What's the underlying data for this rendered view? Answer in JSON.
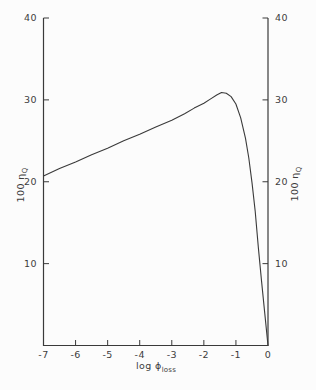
{
  "figure": {
    "background_color": "#fcfcfc",
    "line_color": "#3a3a3a",
    "text_color": "#3d3d3d"
  },
  "chart_data": {
    "type": "line",
    "title": "",
    "xlabel": {
      "text": "log ϕ",
      "sub": "loss"
    },
    "ylabel_left": {
      "text": "100 η",
      "sub": "Q"
    },
    "ylabel_right": {
      "text": "100 η",
      "sub": "Q"
    },
    "xlim": [
      -7,
      0
    ],
    "ylim": [
      0,
      40
    ],
    "x_ticks": [
      -7,
      -6,
      -5,
      -4,
      -3,
      -2,
      -1,
      0
    ],
    "x_tick_labels": [
      "-7",
      "-6",
      "-5",
      "-4",
      "-3",
      "-2",
      "-1",
      "0"
    ],
    "y_ticks": [
      10,
      20,
      30,
      40
    ],
    "y_tick_labels": [
      "10",
      "20",
      "30",
      "40"
    ],
    "grid": false,
    "legend": "none",
    "axes_drawn": [
      "left",
      "bottom",
      "right"
    ],
    "series": [
      {
        "name": "100-eta-Q-vs-log-phi-loss",
        "peak": {
          "x": -1.45,
          "y": 31
        },
        "points": [
          [
            -7.0,
            20.7
          ],
          [
            -6.5,
            21.6
          ],
          [
            -6.0,
            22.4
          ],
          [
            -5.5,
            23.3
          ],
          [
            -5.0,
            24.1
          ],
          [
            -4.5,
            25.0
          ],
          [
            -4.0,
            25.8
          ],
          [
            -3.5,
            26.7
          ],
          [
            -3.0,
            27.5
          ],
          [
            -2.6,
            28.3
          ],
          [
            -2.3,
            29.0
          ],
          [
            -2.0,
            29.6
          ],
          [
            -1.8,
            30.1
          ],
          [
            -1.6,
            30.6
          ],
          [
            -1.45,
            30.9
          ],
          [
            -1.3,
            30.8
          ],
          [
            -1.15,
            30.4
          ],
          [
            -1.0,
            29.5
          ],
          [
            -0.85,
            27.8
          ],
          [
            -0.7,
            25.3
          ],
          [
            -0.6,
            22.9
          ],
          [
            -0.5,
            19.9
          ],
          [
            -0.4,
            16.4
          ],
          [
            -0.3,
            11.9
          ],
          [
            -0.2,
            7.8
          ],
          [
            -0.1,
            3.9
          ],
          [
            0.0,
            0.0
          ]
        ]
      }
    ]
  }
}
